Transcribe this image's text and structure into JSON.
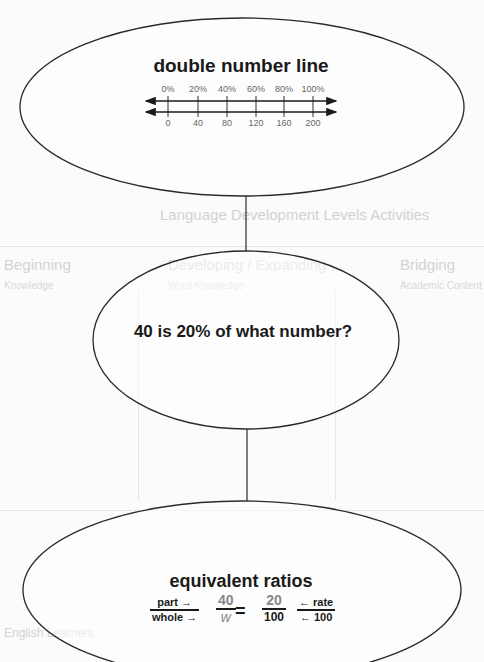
{
  "background": {
    "heading": "Language Development Levels Activities",
    "column_heads": [
      "Beginning",
      "Developing / Expanding",
      "Bridging"
    ],
    "column_subheads": [
      "Knowledge",
      "Word Knowledge",
      "Academic Content"
    ],
    "bottom_heading": "English Learners"
  },
  "nodes": {
    "top": {
      "title": "double number line",
      "percent_labels": [
        "0%",
        "20%",
        "40%",
        "60%",
        "80%",
        "100%"
      ],
      "number_labels": [
        "0",
        "40",
        "80",
        "120",
        "160",
        "200"
      ]
    },
    "middle": {
      "title": "40 is 20% of what number?"
    },
    "bottom": {
      "title": "equivalent ratios",
      "legend_left": {
        "num": "part →",
        "den": "whole →"
      },
      "fraction_unknown": {
        "num": "40",
        "den": "w"
      },
      "equals": "=",
      "fraction_known": {
        "num": "20",
        "den": "100"
      },
      "legend_right": {
        "num": "← rate",
        "den": "← 100"
      }
    }
  },
  "colors": {
    "outline": "#2a2a2a",
    "text": "#1a1a1a",
    "unknown_fraction": "#888888",
    "tick_label": "#666666"
  }
}
